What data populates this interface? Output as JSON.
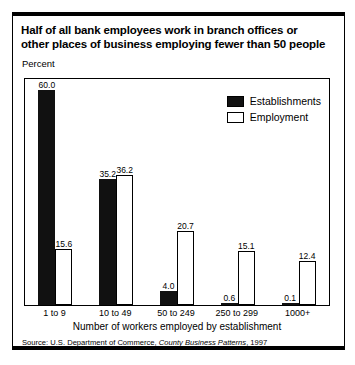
{
  "figure": {
    "title_line1": "Half of all bank employees work in branch offices or",
    "title_line2": "other places of business employing fewer than 50 people",
    "percent_label": "Percent",
    "source_prefix": "Source: U.S. Department of Commerce, ",
    "source_italic": "County Business Patterns",
    "source_suffix": ", 1997"
  },
  "chart_data": {
    "type": "bar",
    "title": "Half of all bank employees work in branch offices or other places of business employing fewer than 50 people",
    "xlabel": "Number of workers employed by establishment",
    "ylabel": "Percent",
    "ylim": [
      0,
      63
    ],
    "grid": false,
    "legend_position": "top-right",
    "categories": [
      "1 to 9",
      "10 to 49",
      "50 to 249",
      "250 to 299",
      "1000+"
    ],
    "series": [
      {
        "name": "Establishments",
        "color": "#111111",
        "values": [
          60.0,
          35.2,
          4.0,
          0.6,
          0.1
        ],
        "labels": [
          "60.0",
          "35.2",
          "4.0",
          "0.6",
          "0.1"
        ]
      },
      {
        "name": "Employment",
        "color": "#ffffff",
        "values": [
          15.6,
          36.2,
          20.7,
          15.1,
          12.4
        ],
        "labels": [
          "15.6",
          "36.2",
          "20.7",
          "15.1",
          "12.4"
        ]
      }
    ]
  }
}
